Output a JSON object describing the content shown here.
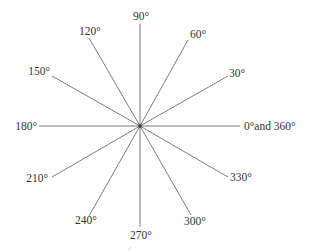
{
  "diagram": {
    "title": "",
    "center": {
      "x": 140,
      "y": 126
    },
    "line_color": "#6b6b6b",
    "text_color": "#333333",
    "rays": [
      {
        "angle": 0,
        "label": "0°and 360°",
        "x2": 240,
        "y2": 126,
        "lx": 244,
        "ly": 130,
        "anchor": "start"
      },
      {
        "angle": 30,
        "label": "30°",
        "x2": 228,
        "y2": 76,
        "lx": 229,
        "ly": 77,
        "anchor": "start"
      },
      {
        "angle": 60,
        "label": "60°",
        "x2": 188,
        "y2": 40,
        "lx": 190,
        "ly": 38,
        "anchor": "start"
      },
      {
        "angle": 90,
        "label": "90°",
        "x2": 140,
        "y2": 24,
        "lx": 141,
        "ly": 20,
        "anchor": "middle"
      },
      {
        "angle": 120,
        "label": "120°",
        "x2": 89,
        "y2": 38,
        "lx": 90,
        "ly": 35,
        "anchor": "middle"
      },
      {
        "angle": 150,
        "label": "150°",
        "x2": 52,
        "y2": 76,
        "lx": 50,
        "ly": 75,
        "anchor": "end"
      },
      {
        "angle": 180,
        "label": "180°",
        "x2": 39,
        "y2": 126,
        "lx": 37,
        "ly": 130,
        "anchor": "end"
      },
      {
        "angle": 210,
        "label": "210°",
        "x2": 52,
        "y2": 177,
        "lx": 48,
        "ly": 182,
        "anchor": "end"
      },
      {
        "angle": 240,
        "label": "240°",
        "x2": 89,
        "y2": 216,
        "lx": 86,
        "ly": 224,
        "anchor": "middle"
      },
      {
        "angle": 270,
        "label": "270°",
        "x2": 140,
        "y2": 227,
        "lx": 141,
        "ly": 239,
        "anchor": "middle"
      },
      {
        "angle": 300,
        "label": "300°",
        "x2": 191,
        "y2": 215,
        "lx": 195,
        "ly": 225,
        "anchor": "middle"
      },
      {
        "angle": 330,
        "label": "330°",
        "x2": 228,
        "y2": 177,
        "lx": 230,
        "ly": 181,
        "anchor": "start"
      }
    ]
  }
}
